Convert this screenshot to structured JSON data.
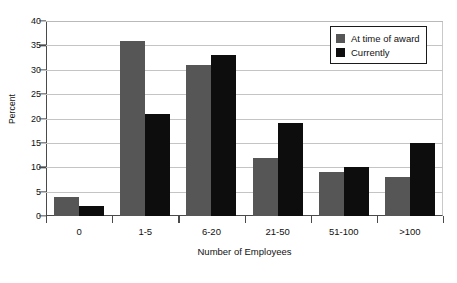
{
  "chart_data": {
    "type": "bar",
    "title": "",
    "subtitle": "",
    "xlabel": "Number of Employees",
    "ylabel": "Percent",
    "categories": [
      "0",
      "1-5",
      "6-20",
      "21-50",
      "51-100",
      ">100"
    ],
    "series": [
      {
        "name": "At time of award",
        "color": "#565656",
        "values": [
          4,
          36,
          31,
          12,
          9,
          8
        ]
      },
      {
        "name": "Currently",
        "color": "#0d0d0d",
        "values": [
          2,
          21,
          33,
          19,
          10,
          15
        ]
      }
    ],
    "ylim": [
      0,
      40
    ],
    "yticks": [
      0,
      5,
      10,
      15,
      20,
      25,
      30,
      35,
      40
    ],
    "ytick_labels": [
      "0",
      "5",
      "10",
      "15",
      "20",
      "25",
      "30",
      "35",
      "40"
    ],
    "grid": true,
    "grid_axis": "y",
    "legend_position": "top-right",
    "legend_entries": [
      "At time of award",
      "Currently"
    ],
    "annotations": []
  }
}
